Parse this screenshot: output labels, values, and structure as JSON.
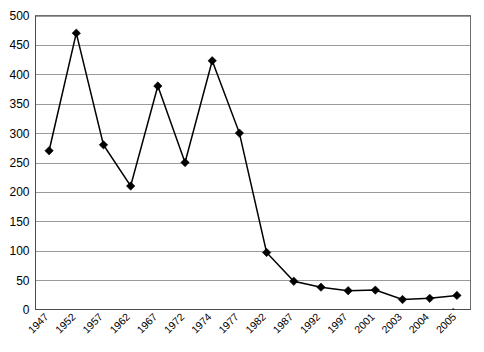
{
  "chart_data": {
    "type": "line",
    "title": "",
    "subtitle": "",
    "xlabel": "",
    "ylabel": "",
    "categories": [
      "1947",
      "1952",
      "1957",
      "1962",
      "1967",
      "1972",
      "1974",
      "1977",
      "1982",
      "1987",
      "1992",
      "1997",
      "2001",
      "2003",
      "2004",
      "2005"
    ],
    "category_notes": {
      "2005": "*"
    },
    "values": [
      270,
      470,
      280,
      210,
      380,
      250,
      423,
      300,
      97,
      48,
      38,
      32,
      33,
      17,
      19,
      24
    ],
    "series": [
      {
        "name": "",
        "values": [
          270,
          470,
          280,
          210,
          380,
          250,
          423,
          300,
          97,
          48,
          38,
          32,
          33,
          17,
          19,
          24
        ]
      }
    ],
    "ylim": [
      0,
      500
    ],
    "yticks": [
      0,
      50,
      100,
      150,
      200,
      250,
      300,
      350,
      400,
      450,
      500
    ],
    "ytick_labels": [
      "0",
      "50",
      "100",
      "150",
      "200",
      "250",
      "300",
      "350",
      "400",
      "450",
      "500"
    ],
    "grid": "horizontal",
    "legend": "none",
    "marker": "diamond",
    "line_color": "#000000",
    "marker_color": "#000000",
    "gridline_color": "#9a9a9a",
    "plot_background": "#ffffff",
    "xtick_rotation": -45
  }
}
